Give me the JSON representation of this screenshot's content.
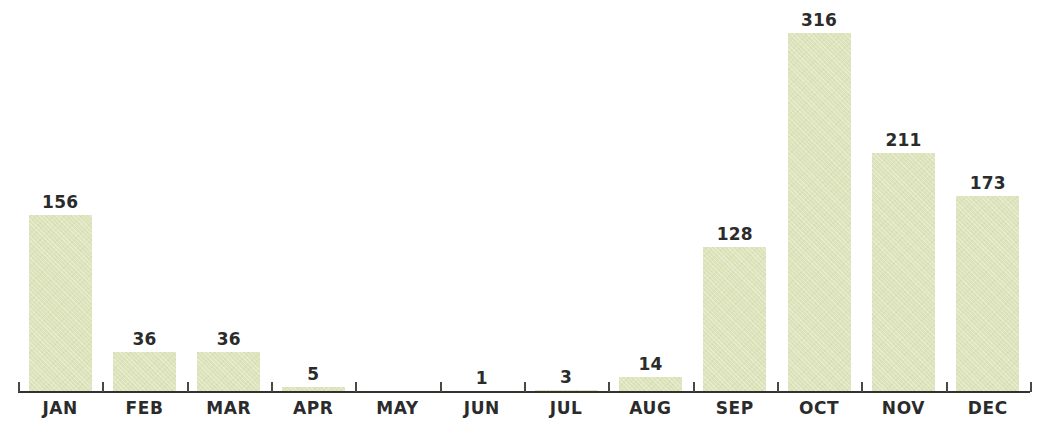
{
  "chart_data": {
    "type": "bar",
    "title": "",
    "subtitle": "",
    "xlabel": "",
    "ylabel": "",
    "categories": [
      "JAN",
      "FEB",
      "MAR",
      "APR",
      "MAY",
      "JUN",
      "JUL",
      "AUG",
      "SEP",
      "OCT",
      "NOV",
      "DEC"
    ],
    "values": [
      156,
      36,
      36,
      5,
      0,
      1,
      3,
      14,
      128,
      316,
      211,
      173
    ],
    "value_labels": [
      "156",
      "36",
      "36",
      "5",
      "",
      "1",
      "3",
      "14",
      "128",
      "316",
      "211",
      "173"
    ],
    "ylim": [
      0,
      316
    ],
    "grid": false,
    "legend": null,
    "data_labels_shown": true,
    "axis": {
      "x_axis_visible": true,
      "y_axis_visible": false,
      "tick_marks_between_categories": true
    },
    "colors": {
      "bar_fill": "#dde4bb",
      "axis_line": "#33312e",
      "tick": "#4a4843",
      "label_text": "#2b2b2b",
      "background": "#ffffff"
    }
  }
}
